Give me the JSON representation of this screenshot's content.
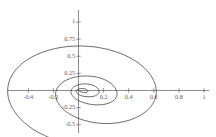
{
  "chart_data": {
    "type": "line",
    "title": "",
    "subtitle": "",
    "xlabel": "",
    "ylabel": "",
    "grid": false,
    "legend": null,
    "axes_style": "cross-at-origin",
    "xlim": [
      -0.52,
      1.02
    ],
    "ylim": [
      -0.58,
      1.14
    ],
    "x_ticks": [
      -0.4,
      -0.2,
      0.2,
      0.4,
      0.6,
      0.8,
      1
    ],
    "x_tick_labels": [
      "-0.4",
      "-0.2",
      "0.2",
      "0.4",
      "0.6",
      "0.8",
      "1"
    ],
    "y_ticks": [
      1,
      0.75,
      0.5,
      0.25,
      -0.25,
      -0.5
    ],
    "y_tick_labels": [
      "1",
      "0.75",
      "0.5",
      "0.25",
      "-0.25",
      "-0.5"
    ],
    "curve_color": "#3c3c3c",
    "axis_color": "#6e6e6e",
    "background_color": "#ffffff",
    "series": [
      {
        "name": "spiral",
        "description": "logarithmic spiral winding outward from the origin",
        "points": [
          [
            0.0,
            0.0
          ],
          [
            0.004,
            -0.006
          ],
          [
            0.012,
            -0.014
          ],
          [
            0.024,
            -0.022
          ],
          [
            0.038,
            -0.028
          ],
          [
            0.052,
            -0.03
          ],
          [
            0.064,
            -0.028
          ],
          [
            0.072,
            -0.02
          ],
          [
            0.074,
            -0.008
          ],
          [
            0.07,
            0.006
          ],
          [
            0.06,
            0.018
          ],
          [
            0.046,
            0.026
          ],
          [
            0.03,
            0.03
          ],
          [
            0.014,
            0.028
          ],
          [
            0.0,
            0.022
          ],
          [
            -0.012,
            0.01
          ],
          [
            -0.018,
            -0.006
          ],
          [
            -0.018,
            -0.024
          ],
          [
            -0.01,
            -0.044
          ],
          [
            0.006,
            -0.064
          ],
          [
            0.03,
            -0.08
          ],
          [
            0.06,
            -0.09
          ],
          [
            0.092,
            -0.092
          ],
          [
            0.122,
            -0.084
          ],
          [
            0.146,
            -0.066
          ],
          [
            0.16,
            -0.04
          ],
          [
            0.164,
            -0.008
          ],
          [
            0.156,
            0.026
          ],
          [
            0.138,
            0.056
          ],
          [
            0.11,
            0.08
          ],
          [
            0.076,
            0.094
          ],
          [
            0.038,
            0.096
          ],
          [
            0.002,
            0.086
          ],
          [
            -0.028,
            0.064
          ],
          [
            -0.05,
            0.032
          ],
          [
            -0.06,
            -0.008
          ],
          [
            -0.056,
            -0.052
          ],
          [
            -0.038,
            -0.098
          ],
          [
            -0.006,
            -0.14
          ],
          [
            0.038,
            -0.176
          ],
          [
            0.09,
            -0.2
          ],
          [
            0.146,
            -0.21
          ],
          [
            0.2,
            -0.204
          ],
          [
            0.248,
            -0.18
          ],
          [
            0.284,
            -0.14
          ],
          [
            0.304,
            -0.086
          ],
          [
            0.306,
            -0.022
          ],
          [
            0.29,
            0.044
          ],
          [
            0.256,
            0.108
          ],
          [
            0.206,
            0.16
          ],
          [
            0.144,
            0.196
          ],
          [
            0.074,
            0.212
          ],
          [
            0.002,
            0.206
          ],
          [
            -0.066,
            0.176
          ],
          [
            -0.124,
            0.124
          ],
          [
            -0.164,
            0.05
          ],
          [
            -0.182,
            -0.038
          ],
          [
            -0.174,
            -0.138
          ],
          [
            -0.14,
            -0.238
          ],
          [
            -0.082,
            -0.33
          ],
          [
            -0.002,
            -0.406
          ],
          [
            0.094,
            -0.458
          ],
          [
            0.2,
            -0.482
          ],
          [
            0.31,
            -0.472
          ],
          [
            0.414,
            -0.428
          ],
          [
            0.504,
            -0.35
          ],
          [
            0.572,
            -0.244
          ],
          [
            0.612,
            -0.114
          ],
          [
            0.618,
            0.03
          ],
          [
            0.588,
            0.184
          ],
          [
            0.524,
            0.33
          ],
          [
            0.428,
            0.46
          ],
          [
            0.304,
            0.562
          ],
          [
            0.16,
            0.628
          ],
          [
            0.004,
            0.65
          ],
          [
            -0.154,
            0.624
          ],
          [
            -0.302,
            0.548
          ],
          [
            -0.428,
            0.424
          ],
          [
            -0.518,
            0.258
          ],
          [
            -0.562,
            0.062
          ],
          [
            -0.552,
            -0.152
          ],
          [
            -0.486,
            -0.366
          ],
          [
            -0.364,
            -0.564
          ],
          [
            -0.194,
            -0.722
          ],
          [
            0.012,
            -0.824
          ],
          [
            0.24,
            -0.858
          ],
          [
            0.474,
            -0.814
          ],
          [
            0.694,
            -0.69
          ],
          [
            0.88,
            -0.49
          ],
          [
            1.014,
            -0.228
          ],
          [
            1.082,
            0.078
          ],
          [
            1.074,
            0.402
          ],
          [
            0.988,
            0.714
          ],
          [
            0.828,
            0.988
          ],
          [
            0.606,
            1.196
          ]
        ]
      }
    ]
  },
  "plot": {
    "x_axis_name": "x-axis",
    "y_axis_name": "y-axis",
    "curve_name": "spiral-curve"
  }
}
